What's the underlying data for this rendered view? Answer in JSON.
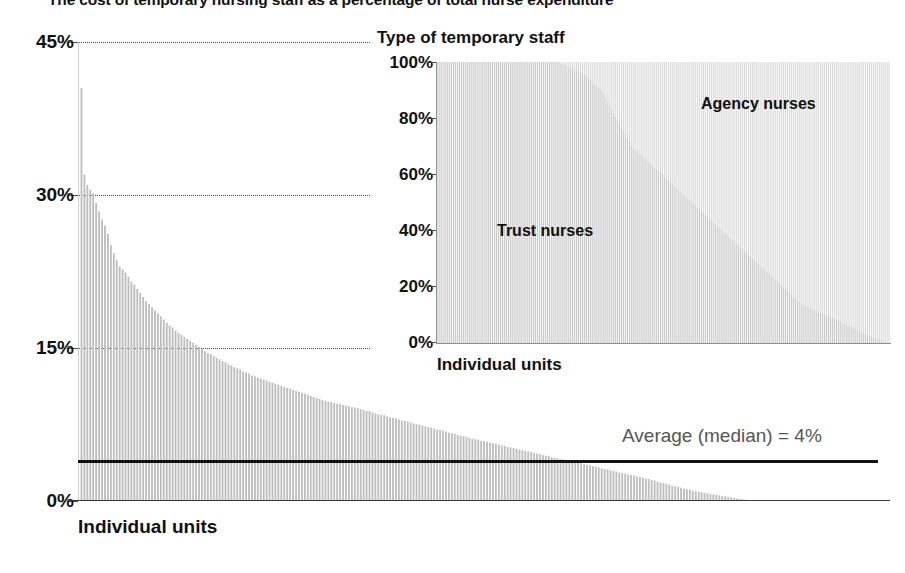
{
  "title": "The cost of temporary nursing staff as a percentage of total nurse expenditure",
  "main_chart": {
    "xlabel": "Individual units",
    "yticks": [
      "45%",
      "30%",
      "15%",
      "0%"
    ],
    "median_label": "Average (median) = 4%"
  },
  "inset_chart": {
    "title": "Type of temporary staff",
    "xlabel": "Individual units",
    "yticks": [
      "100%",
      "80%",
      "60%",
      "40%",
      "20%",
      "0%"
    ],
    "series_label_top": "Agency nurses",
    "series_label_bottom": "Trust nurses"
  },
  "colors": {
    "bar": "#bdbdbd",
    "trust": "#c9c9c9",
    "agency": "#dadada",
    "median_line": "#111111",
    "axis": "#4a4a4a",
    "text": "#111111",
    "median_text": "#555555"
  },
  "chart_data": [
    {
      "type": "bar",
      "title": "The cost of temporary nursing staff as a percentage of total nurse expenditure",
      "xlabel": "Individual units",
      "ylabel": "",
      "ylim": [
        0,
        45
      ],
      "grid": true,
      "gridlines": [
        15,
        30,
        45
      ],
      "tick_labels": [
        "0%",
        "15%",
        "30%",
        "45%"
      ],
      "legend": "none",
      "annotations": [
        {
          "text": "Average (median) = 4%",
          "type": "hline",
          "value": 4
        }
      ],
      "note": "Approximately 230 individual nursing units sorted descending by temporary-staff cost share.",
      "categories_count": 230,
      "values": [
        40.5,
        32.0,
        31.0,
        30.5,
        30.2,
        29.2,
        28.4,
        27.6,
        27.0,
        26.2,
        25.1,
        24.3,
        23.6,
        23.0,
        22.7,
        22.4,
        22.0,
        21.5,
        21.2,
        20.8,
        20.4,
        20.0,
        19.6,
        19.3,
        19.0,
        18.7,
        18.4,
        18.1,
        17.8,
        17.5,
        17.2,
        17.0,
        16.7,
        16.5,
        16.3,
        16.1,
        15.9,
        15.7,
        15.5,
        15.3,
        15.1,
        14.9,
        14.7,
        14.5,
        14.4,
        14.2,
        14.0,
        13.9,
        13.7,
        13.6,
        13.4,
        13.3,
        13.1,
        13.0,
        12.9,
        12.7,
        12.6,
        12.5,
        12.3,
        12.2,
        12.1,
        12.0,
        11.9,
        11.8,
        11.7,
        11.6,
        11.5,
        11.4,
        11.3,
        11.2,
        11.1,
        11.0,
        10.9,
        10.8,
        10.7,
        10.6,
        10.5,
        10.4,
        10.3,
        10.2,
        10.1,
        10.0,
        9.9,
        9.8,
        9.75,
        9.7,
        9.6,
        9.55,
        9.5,
        9.4,
        9.35,
        9.3,
        9.2,
        9.15,
        9.1,
        9.0,
        8.9,
        8.85,
        8.8,
        8.7,
        8.6,
        8.5,
        8.45,
        8.4,
        8.3,
        8.2,
        8.15,
        8.1,
        8.0,
        7.9,
        7.85,
        7.8,
        7.7,
        7.6,
        7.55,
        7.5,
        7.4,
        7.3,
        7.25,
        7.2,
        7.1,
        7.0,
        6.95,
        6.9,
        6.8,
        6.7,
        6.65,
        6.6,
        6.5,
        6.4,
        6.35,
        6.3,
        6.2,
        6.1,
        6.05,
        6.0,
        5.9,
        5.85,
        5.8,
        5.7,
        5.65,
        5.6,
        5.5,
        5.45,
        5.4,
        5.3,
        5.25,
        5.2,
        5.1,
        5.05,
        5.0,
        4.9,
        4.85,
        4.8,
        4.7,
        4.65,
        4.6,
        4.5,
        4.45,
        4.4,
        4.3,
        4.25,
        4.2,
        4.1,
        4.05,
        4.0,
        3.95,
        3.9,
        3.8,
        3.75,
        3.7,
        3.6,
        3.55,
        3.5,
        3.4,
        3.35,
        3.3,
        3.2,
        3.15,
        3.1,
        3.0,
        2.95,
        2.9,
        2.8,
        2.75,
        2.7,
        2.6,
        2.55,
        2.5,
        2.4,
        2.35,
        2.3,
        2.2,
        2.15,
        2.05,
        2.0,
        1.9,
        1.8,
        1.75,
        1.7,
        1.6,
        1.5,
        1.45,
        1.4,
        1.3,
        1.2,
        1.15,
        1.1,
        1.0,
        0.95,
        0.9,
        0.85,
        0.8,
        0.75,
        0.7,
        0.65,
        0.6,
        0.55,
        0.5,
        0.45,
        0.4,
        0.35,
        0.3,
        0.25,
        0.2,
        0.17,
        0.14,
        0.11,
        0.08,
        0.05
      ]
    },
    {
      "type": "bar",
      "stacked": true,
      "normalized": true,
      "title": "Type of temporary staff",
      "xlabel": "Individual units",
      "ylabel": "",
      "ylim": [
        0,
        100
      ],
      "tick_labels": [
        "0%",
        "20%",
        "40%",
        "60%",
        "80%",
        "100%"
      ],
      "legend": "in-plot",
      "categories_count": 150,
      "series": [
        {
          "name": "Trust nurses",
          "note": "Bottom segment, light grey. Starts near 100% for the left-hand units and falls steadily to near 0% at the right-hand units.",
          "values": [
            100,
            100,
            100,
            100,
            100,
            100,
            100,
            100,
            100,
            100,
            100,
            100,
            100,
            100,
            100,
            100,
            100,
            100,
            100,
            100,
            100,
            100,
            100,
            100,
            100,
            100,
            100,
            100,
            100,
            100,
            100,
            100,
            100,
            100,
            100,
            100,
            100,
            100,
            100,
            100,
            100,
            99,
            99,
            98,
            98,
            97,
            97,
            96,
            96,
            95,
            94,
            93,
            92,
            91,
            90,
            88,
            86,
            84,
            82,
            80,
            78,
            76,
            74,
            72,
            70,
            69,
            68,
            67,
            66,
            65,
            64,
            63,
            62,
            61,
            60,
            59,
            58,
            57,
            56,
            55,
            54,
            53,
            52,
            51,
            50,
            49,
            48,
            47,
            46,
            45,
            44,
            43,
            42,
            41,
            40,
            39,
            38,
            37,
            36,
            35,
            34,
            33,
            32,
            31,
            30,
            29,
            28,
            27,
            26,
            25,
            24,
            23,
            22,
            21,
            20,
            19,
            18,
            17,
            16,
            15,
            14,
            13.5,
            13,
            12.5,
            12,
            11.5,
            11,
            10.5,
            10,
            9.5,
            9,
            8.5,
            8,
            7.5,
            7,
            6.5,
            6,
            5.5,
            5,
            4.5,
            4,
            3.5,
            3,
            2.5,
            2,
            1.6,
            1.2,
            0.8,
            0.4,
            0
          ]
        },
        {
          "name": "Agency nurses",
          "note": "Top segment, lighter grey. Complement of Trust nurses so each bar totals 100%.",
          "values": [
            0,
            0,
            0,
            0,
            0,
            0,
            0,
            0,
            0,
            0,
            0,
            0,
            0,
            0,
            0,
            0,
            0,
            0,
            0,
            0,
            0,
            0,
            0,
            0,
            0,
            0,
            0,
            0,
            0,
            0,
            0,
            0,
            0,
            0,
            0,
            0,
            0,
            0,
            0,
            0,
            0,
            1,
            1,
            2,
            2,
            3,
            3,
            4,
            4,
            5,
            6,
            7,
            8,
            9,
            10,
            12,
            14,
            16,
            18,
            20,
            22,
            24,
            26,
            28,
            30,
            31,
            32,
            33,
            34,
            35,
            36,
            37,
            38,
            39,
            40,
            41,
            42,
            43,
            44,
            45,
            46,
            47,
            48,
            49,
            50,
            51,
            52,
            53,
            54,
            55,
            56,
            57,
            58,
            59,
            60,
            61,
            62,
            63,
            64,
            65,
            66,
            67,
            68,
            69,
            70,
            71,
            72,
            73,
            74,
            75,
            76,
            77,
            78,
            79,
            80,
            81,
            82,
            83,
            84,
            85,
            86,
            86.5,
            87,
            87.5,
            88,
            88.5,
            89,
            89.5,
            90,
            90.5,
            91,
            91.5,
            92,
            92.5,
            93,
            93.5,
            94,
            94.5,
            95,
            95.5,
            96,
            96.5,
            97,
            97.5,
            98,
            98.4,
            98.8,
            99.2,
            99.6,
            100
          ]
        }
      ]
    }
  ]
}
